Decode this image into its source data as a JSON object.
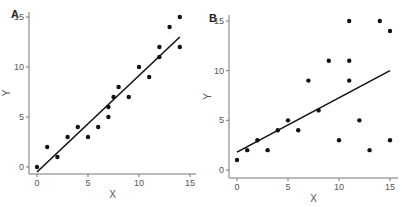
{
  "chart_data": [
    {
      "panel": "A",
      "type": "scatter",
      "title": "",
      "xlabel": "X",
      "ylabel": "Y",
      "xlim": [
        -1,
        16
      ],
      "ylim": [
        -1,
        16
      ],
      "xticks": [
        0,
        5,
        10,
        15
      ],
      "yticks": [
        0,
        5,
        10,
        15
      ],
      "grid": false,
      "points": [
        [
          0,
          0
        ],
        [
          1,
          2
        ],
        [
          2,
          1
        ],
        [
          3,
          3
        ],
        [
          4,
          4
        ],
        [
          5,
          3
        ],
        [
          6,
          4
        ],
        [
          7,
          5
        ],
        [
          7,
          6
        ],
        [
          7.5,
          7
        ],
        [
          8,
          8
        ],
        [
          9,
          7
        ],
        [
          10,
          10
        ],
        [
          11,
          9
        ],
        [
          12,
          11
        ],
        [
          12,
          12
        ],
        [
          13,
          14
        ],
        [
          14,
          12
        ],
        [
          14,
          15
        ]
      ],
      "fit_line": {
        "x": [
          0,
          14
        ],
        "y": [
          -0.5,
          13
        ]
      }
    },
    {
      "panel": "B",
      "type": "scatter",
      "title": "",
      "xlabel": "X",
      "ylabel": "Y",
      "xlim": [
        -1,
        16
      ],
      "ylim": [
        -1,
        16
      ],
      "xticks": [
        0,
        5,
        10,
        15
      ],
      "yticks": [
        0,
        5,
        10,
        15
      ],
      "grid": false,
      "points": [
        [
          0,
          1
        ],
        [
          1,
          2
        ],
        [
          2,
          3
        ],
        [
          3,
          2
        ],
        [
          4,
          4
        ],
        [
          5,
          5
        ],
        [
          6,
          4
        ],
        [
          7,
          9
        ],
        [
          8,
          6
        ],
        [
          9,
          11
        ],
        [
          10,
          3
        ],
        [
          11,
          15
        ],
        [
          11,
          11
        ],
        [
          11,
          9
        ],
        [
          12,
          5
        ],
        [
          13,
          2
        ],
        [
          14,
          15
        ],
        [
          15,
          14
        ],
        [
          15,
          3
        ]
      ],
      "fit_line": {
        "x": [
          0,
          15
        ],
        "y": [
          1.8,
          10
        ]
      }
    }
  ],
  "panels": {
    "a": {
      "label": "A"
    },
    "b": {
      "label": "B"
    }
  }
}
